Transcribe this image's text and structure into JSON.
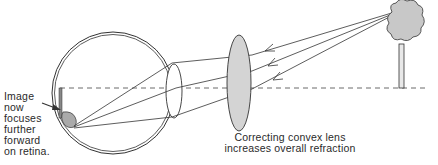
{
  "diagram": {
    "labels": {
      "retina": [
        "Image",
        "now",
        "focuses",
        "further",
        "forward",
        "on retina."
      ],
      "lens": [
        "Correcting convex lens",
        "increases overall refraction"
      ]
    },
    "elements": {
      "eye": "eyeball cross-section with crystalline lens",
      "corrective_lens": "convex lens (shaded gray)",
      "object": "tree",
      "optical_axis": "dashed horizontal line",
      "rays": 3
    },
    "colors": {
      "line": "#333333",
      "lens_fill": "#d4d4d4",
      "tree_fill": "#c8c8c8",
      "background": "#ffffff"
    }
  }
}
